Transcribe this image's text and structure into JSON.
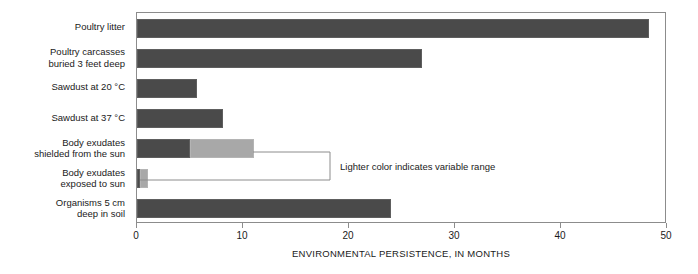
{
  "chart_data": {
    "type": "bar",
    "orientation": "horizontal",
    "title": "",
    "subtitle": "",
    "xlabel": "ENVIRONMENTAL PERSISTENCE, IN MONTHS",
    "ylabel": "",
    "xlim": [
      0,
      50
    ],
    "xticks": [
      0,
      10,
      20,
      30,
      40,
      50
    ],
    "xticklabels": [
      "0",
      "10",
      "20",
      "30",
      "40",
      "50"
    ],
    "grid": false,
    "legend": null,
    "categories": [
      "Poultry litter",
      "Poultry carcasses\nburied 3 feet deep",
      "Sawdust at 20 °C",
      "Sawdust at 37 °C",
      "Body exudates\nshielded from the sun",
      "Body exudates\nexposed to sun",
      "Organisms 5 cm\ndeep in soil"
    ],
    "series": [
      {
        "name": "Typical value",
        "color": "#4a4a4a",
        "values": [
          48.3,
          26.9,
          5.7,
          8.1,
          5.0,
          0.3,
          24.0
        ]
      },
      {
        "name": "Variable range (lighter color)",
        "color": "#a8a8a8",
        "values": [
          0,
          0,
          0,
          0,
          6.0,
          0.7,
          0
        ]
      }
    ],
    "range_totals": [
      48.3,
      26.9,
      5.7,
      8.1,
      11.0,
      1.0,
      24.0
    ],
    "annotations": [
      {
        "text": "Lighter color indicates variable range",
        "type": "bracket-callout",
        "targets": [
          "Body exudates shielded from the sun",
          "Body exudates exposed to sun"
        ]
      }
    ],
    "colors": {
      "bar_dark": "#4a4a4a",
      "bar_light": "#a8a8a8",
      "axis": "#8c8c8c",
      "text": "#1a1a1a",
      "background": "#ffffff"
    }
  }
}
